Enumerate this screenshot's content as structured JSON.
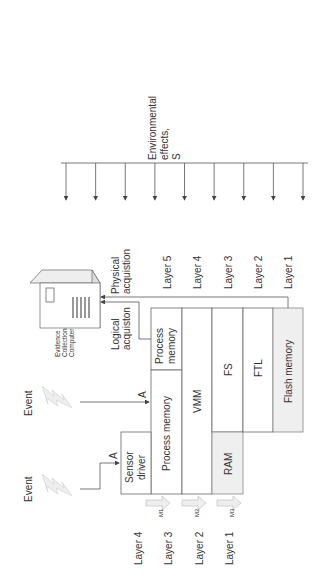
{
  "environment": {
    "label_lines": [
      "Environmental",
      "effects,",
      "S"
    ],
    "arrow_count": 9
  },
  "right_layers": [
    "Layer 5",
    "Layer 4",
    "Layer 3",
    "Layer 2",
    "Layer 1"
  ],
  "left_layers": [
    "Layer 4",
    "Layer 3",
    "Layer 2",
    "Layer 1"
  ],
  "acquisition": {
    "physical": [
      "Physical",
      "acquistion"
    ],
    "logical": [
      "Logical",
      "acquiston"
    ]
  },
  "computer": {
    "label_lines": [
      "Evidence",
      "Collection",
      "Computer"
    ]
  },
  "blocks": {
    "process_memory_top": [
      "Process",
      "memory"
    ],
    "process_memory": "Process memory",
    "sensor_driver": [
      "Sensor",
      "driver"
    ],
    "vmm": "VMM",
    "fs": "FS",
    "ftl": "FTL",
    "ram": "RAM",
    "flash": "Flash memory"
  },
  "events": {
    "label": "Event",
    "arrow_label": "A"
  },
  "migrations": [
    "M1",
    "M2",
    "M3"
  ]
}
